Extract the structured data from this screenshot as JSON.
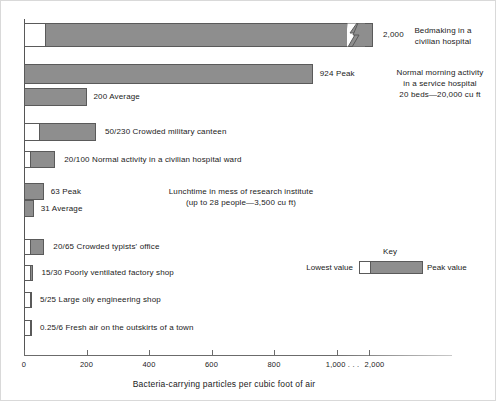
{
  "chart_data": {
    "type": "bar",
    "title": "",
    "xlabel": "Bacteria-carrying particles per cubic foot of air",
    "ylabel": "",
    "orientation": "horizontal",
    "xlim": [
      0,
      1000
    ],
    "grid": false,
    "axis_note": "Axis is broken after 1,000; the 2,000 value for the top bar is shown past a break mark.",
    "tick_values": [
      0,
      200,
      400,
      600,
      800,
      1000,
      2000
    ],
    "tick_labels": [
      "0",
      "200",
      "400",
      "600",
      "800",
      "1,000 . . .",
      "2,000"
    ],
    "legend": {
      "title": "Key",
      "low_label": "Lowest value",
      "peak_label": "Peak value"
    },
    "categories": [
      "Bedmaking in a civilian hospital",
      "Normal morning activity in a service hospital",
      "Crowded military canteen",
      "Normal activity in a civilian hospital ward",
      "Lunchtime in mess of research institute",
      "Crowded typists' office",
      "Poorly ventilated factory shop",
      "Large oily engineering shop",
      "Fresh air on the outskirts of a town"
    ],
    "series": [
      {
        "name": "Lowest value",
        "values": [
          70,
          null,
          50,
          20,
          null,
          20,
          15,
          5,
          0.25
        ]
      },
      {
        "name": "Peak value",
        "values": [
          2000,
          924,
          230,
          100,
          63,
          65,
          30,
          25,
          6
        ]
      },
      {
        "name": "Average",
        "values": [
          null,
          200,
          null,
          null,
          31,
          null,
          null,
          null,
          null
        ]
      }
    ]
  },
  "rows": [
    {
      "id": "bedmaking",
      "low": 70,
      "peak": 2000,
      "broken": true,
      "value_label": "2,000",
      "desc_lines": [
        "Bedmaking in a",
        "civilian hospital"
      ]
    },
    {
      "id": "service-hospital-peak",
      "low": null,
      "peak": 924,
      "broken": false,
      "value_label": "924 Peak",
      "desc_lines": [
        "Normal morning activity",
        "in a service hospital",
        "20 beds—20,000 cu ft"
      ]
    },
    {
      "id": "service-hospital-average",
      "low": null,
      "peak": 200,
      "broken": false,
      "value_label": "200 Average",
      "desc_lines": []
    },
    {
      "id": "military-canteen",
      "low": 50,
      "peak": 230,
      "broken": false,
      "value_label": "50/230 Crowded military canteen",
      "desc_lines": []
    },
    {
      "id": "civilian-hospital-ward",
      "low": 20,
      "peak": 100,
      "broken": false,
      "value_label": "20/100 Normal activity in a civilian hospital ward",
      "desc_lines": []
    },
    {
      "id": "research-mess-peak",
      "low": null,
      "peak": 63,
      "broken": false,
      "value_label": "63 Peak",
      "desc_lines": [
        "Lunchtime in mess of research institute",
        "(up to 28 people—3,500 cu ft)"
      ]
    },
    {
      "id": "research-mess-average",
      "low": null,
      "peak": 31,
      "broken": false,
      "value_label": "31 Average",
      "desc_lines": []
    },
    {
      "id": "typists-office",
      "low": 20,
      "peak": 65,
      "broken": false,
      "value_label": "20/65  Crowded typists' office",
      "desc_lines": []
    },
    {
      "id": "factory-shop",
      "low": 15,
      "peak": 30,
      "broken": false,
      "value_label": "15/30 Poorly ventilated factory shop",
      "desc_lines": []
    },
    {
      "id": "engineering-shop",
      "low": 5,
      "peak": 25,
      "broken": false,
      "value_label": "5/25  Large oily engineering shop",
      "desc_lines": []
    },
    {
      "id": "fresh-air",
      "low": 0.25,
      "peak": 6,
      "broken": false,
      "value_label": "0.25/6  Fresh air on the outskirts of a town",
      "desc_lines": []
    }
  ],
  "colors": {
    "bar_peak": "#8e8e8e",
    "bar_low": "#ffffff",
    "outline": "#5a5a5a",
    "axis": "#6b6b6b",
    "text": "#1a1a1a"
  }
}
